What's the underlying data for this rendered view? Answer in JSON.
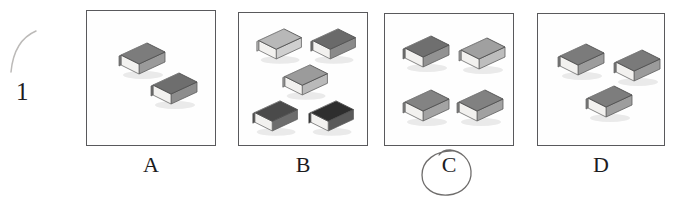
{
  "question": {
    "number": "1",
    "pencil_stray_mark": "curved-pencil-stroke"
  },
  "options": [
    {
      "letter": "A",
      "book_count": 2,
      "circled": false,
      "panel": {
        "x": 86,
        "y": 10,
        "w": 130,
        "h": 136
      },
      "letter_pos": {
        "x": 131,
        "y": 152
      },
      "books": [
        {
          "x": 26,
          "y": 28,
          "shade": "#7c7c7c",
          "side": "#9a9a9a",
          "scale": 1.0
        },
        {
          "x": 58,
          "y": 58,
          "shade": "#6e6e6e",
          "side": "#8d8d8d",
          "scale": 1.0
        }
      ]
    },
    {
      "letter": "B",
      "book_count": 5,
      "circled": false,
      "panel": {
        "x": 238,
        "y": 12,
        "w": 130,
        "h": 134
      },
      "letter_pos": {
        "x": 283,
        "y": 152
      },
      "books": [
        {
          "x": 12,
          "y": 12,
          "shade": "#b8b8b8",
          "side": "#cfcfcf",
          "scale": 0.97
        },
        {
          "x": 66,
          "y": 12,
          "shade": "#6a6a6a",
          "side": "#8a8a8a",
          "scale": 0.97
        },
        {
          "x": 38,
          "y": 48,
          "shade": "#9b9b9b",
          "side": "#b9b9b9",
          "scale": 0.97
        },
        {
          "x": 8,
          "y": 84,
          "shade": "#4a4a4a",
          "side": "#6d6d6d",
          "scale": 0.97
        },
        {
          "x": 64,
          "y": 84,
          "shade": "#2e2e2e",
          "side": "#5a5a5a",
          "scale": 0.97
        }
      ]
    },
    {
      "letter": "C",
      "book_count": 4,
      "circled": true,
      "panel": {
        "x": 384,
        "y": 13,
        "w": 130,
        "h": 133
      },
      "letter_pos": {
        "x": 429,
        "y": 152
      },
      "books": [
        {
          "x": 12,
          "y": 18,
          "shade": "#6f6f6f",
          "side": "#929292",
          "scale": 1.0
        },
        {
          "x": 68,
          "y": 20,
          "shade": "#a0a0a0",
          "side": "#bdbdbd",
          "scale": 1.0
        },
        {
          "x": 12,
          "y": 72,
          "shade": "#838383",
          "side": "#a3a3a3",
          "scale": 1.0
        },
        {
          "x": 66,
          "y": 72,
          "shade": "#818181",
          "side": "#a1a1a1",
          "scale": 1.0
        }
      ]
    },
    {
      "letter": "D",
      "book_count": 3,
      "circled": false,
      "panel": {
        "x": 537,
        "y": 13,
        "w": 128,
        "h": 133
      },
      "letter_pos": {
        "x": 581,
        "y": 152
      },
      "books": [
        {
          "x": 14,
          "y": 26,
          "shade": "#7b7b7b",
          "side": "#9c9c9c",
          "scale": 1.0
        },
        {
          "x": 70,
          "y": 32,
          "shade": "#7a7a7a",
          "side": "#9b9b9b",
          "scale": 1.0
        },
        {
          "x": 42,
          "y": 68,
          "shade": "#7d7d7d",
          "side": "#9d9d9d",
          "scale": 1.0
        }
      ]
    }
  ],
  "colors": {
    "ink": "#1d1d1f",
    "panel_border": "#59595c",
    "paper": "#ffffff",
    "pencil": "#b9b7b5"
  }
}
